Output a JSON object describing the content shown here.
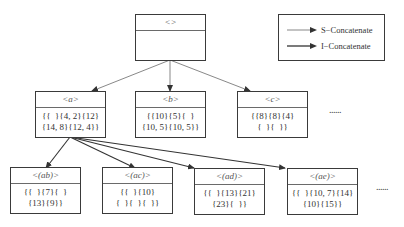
{
  "legend": {
    "items": [
      {
        "label": "S−Concatenate",
        "style": "thin"
      },
      {
        "label": "I−Concatenate",
        "style": "thick"
      }
    ]
  },
  "nodes": {
    "root": {
      "label": "<>",
      "lines": [
        "",
        ""
      ]
    },
    "a": {
      "label": "<a>",
      "lines": [
        "{{  }{4, 2}{12}",
        "{14, 8}{12, 4}}"
      ]
    },
    "b": {
      "label": "<b>",
      "lines": [
        "{{10}{5}{  }",
        "{10, 5}{10, 5}}"
      ]
    },
    "c": {
      "label": "<c>",
      "lines": [
        "{{8}{8}{4}",
        "{  }{  }}"
      ]
    },
    "ab": {
      "label": "<(ab)>",
      "lines": [
        "{{  }{7}{  }",
        "{13}{9}}"
      ]
    },
    "ac": {
      "label": "<(ac)>",
      "lines": [
        "{{  }{10}",
        "{  }{  }{  }}"
      ]
    },
    "ad": {
      "label": "<(ad)>",
      "lines": [
        "{{  }{13}{21}",
        "{23}{  }}"
      ]
    },
    "ae": {
      "label": "<(ae)>",
      "lines": [
        "{{  }{10, 7}{14}",
        "{10}{15}}"
      ]
    }
  },
  "ellipsis": {
    "level2": "......",
    "level3": "......"
  },
  "edges": [
    {
      "from": "root",
      "to": "a",
      "type": "S-Concatenate"
    },
    {
      "from": "root",
      "to": "b",
      "type": "S-Concatenate"
    },
    {
      "from": "root",
      "to": "c",
      "type": "S-Concatenate"
    },
    {
      "from": "a",
      "to": "ab",
      "type": "I-Concatenate"
    },
    {
      "from": "a",
      "to": "ac",
      "type": "S-Concatenate"
    },
    {
      "from": "a",
      "to": "ad",
      "type": "S-Concatenate"
    },
    {
      "from": "a",
      "to": "ae",
      "type": "S-Concatenate"
    }
  ]
}
